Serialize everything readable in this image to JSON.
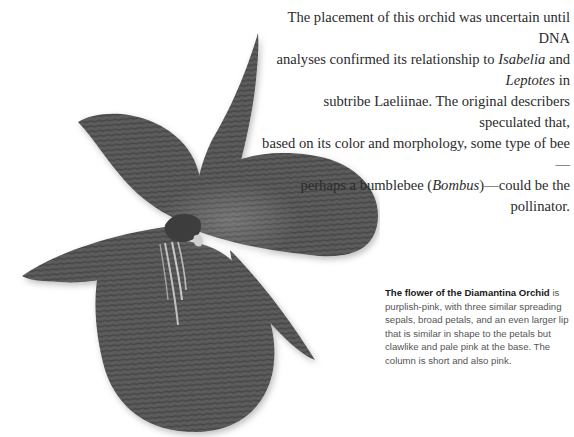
{
  "intro": {
    "line1": "The placement of this orchid was uncertain until DNA",
    "line2_a": "analyses confirmed its relationship to ",
    "line2_b": "Isabelia",
    "line2_c": " and ",
    "line2_d": "Leptotes",
    "line2_e": " in",
    "line3": "subtribe Laeliinae. The original describers speculated that,",
    "line4": "based on its color and morphology, some type of bee—",
    "line5_a": "perhaps a bumblebee (",
    "line5_b": "Bombus",
    "line5_c": ")—could be the pollinator."
  },
  "caption": {
    "bold": "The flower of the Diamantina Orchid",
    "rest": " is purplish-pink, with three similar spreading sepals, broad petals, and an even larger lip that is similar in shape to the petals but clawlike and pale pink at the base. The column is short and also pink."
  },
  "image": {
    "subject": "diamantina-orchid-flower",
    "color": "#5a5a5a"
  }
}
